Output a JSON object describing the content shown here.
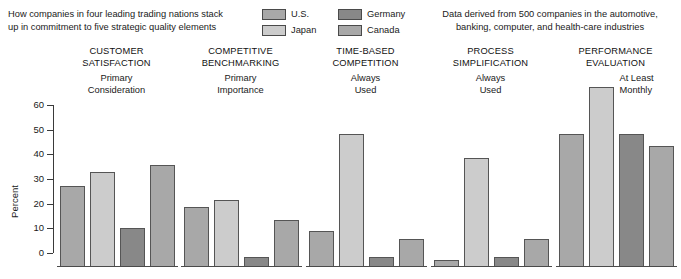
{
  "header": {
    "caption_left_line1": "How companies in four leading trading nations stack",
    "caption_left_line2": "up in commitment to five strategic quality elements",
    "caption_right_line1": "Data derived from 500 companies in the automotive,",
    "caption_right_line2": "banking, computer, and health-care industries"
  },
  "legend": {
    "items": [
      {
        "label": "U.S.",
        "color": "#a8a8a8"
      },
      {
        "label": "Germany",
        "color": "#888888"
      },
      {
        "label": "Japan",
        "color": "#cccccc"
      },
      {
        "label": "Canada",
        "color": "#a8a8a8"
      }
    ]
  },
  "axis": {
    "ylabel": "Percent",
    "ticks": [
      "60",
      "50",
      "40",
      "30",
      "20",
      "10",
      "0"
    ]
  },
  "groups": [
    {
      "title_line1": "CUSTOMER",
      "title_line2": "SATISFACTION",
      "sub_line1": "Primary",
      "sub_line2": "Consideration"
    },
    {
      "title_line1": "COMPETITIVE",
      "title_line2": "BENCHMARKING",
      "sub_line1": "Primary",
      "sub_line2": "Importance"
    },
    {
      "title_line1": "TIME-BASED",
      "title_line2": "COMPETITION",
      "sub_line1": "Always",
      "sub_line2": "Used"
    },
    {
      "title_line1": "PROCESS",
      "title_line2": "SIMPLIFICATION",
      "sub_line1": "Always",
      "sub_line2": "Used"
    },
    {
      "title_line1": "PERFORMANCE",
      "title_line2": "EVALUATION",
      "sub_line1": "At Least",
      "sub_line2": "Monthly"
    }
  ],
  "chart_data": {
    "type": "bar",
    "title": "How companies in four leading trading nations stack up in commitment to five strategic quality elements",
    "subtitle": "Data derived from 500 companies in the automotive, banking, computer, and health-care industries",
    "xlabel": "",
    "ylabel": "Percent",
    "ylim": [
      0,
      60
    ],
    "yticks": [
      0,
      10,
      20,
      30,
      40,
      50,
      60
    ],
    "grid": false,
    "legend_position": "top-center",
    "categories": [
      "CUSTOMER SATISFACTION — Primary Consideration",
      "COMPETITIVE BENCHMARKING — Primary Importance",
      "TIME-BASED COMPETITION — Always Used",
      "PROCESS SIMPLIFICATION — Always Used",
      "PERFORMANCE EVALUATION — At Least Monthly"
    ],
    "series": [
      {
        "name": "U.S.",
        "color": "#a8a8a8",
        "values": [
          33,
          24.5,
          14.5,
          3,
          54
        ]
      },
      {
        "name": "Japan",
        "color": "#cccccc",
        "values": [
          38.5,
          27,
          54,
          44,
          73
        ]
      },
      {
        "name": "Germany",
        "color": "#888888",
        "values": [
          16,
          4,
          4,
          4,
          54
        ]
      },
      {
        "name": "Canada",
        "color": "#a8a8a8",
        "values": [
          41.5,
          19,
          11.5,
          11.5,
          49
        ]
      }
    ]
  }
}
